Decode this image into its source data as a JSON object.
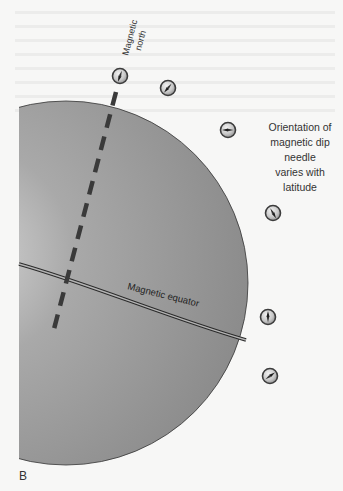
{
  "figure": {
    "panel_label": "B",
    "axis_label_line1": "Magnetic",
    "axis_label_line2": "north",
    "equator_label": "Magnetic equator",
    "caption_lines": [
      "Orientation of",
      "magnetic dip",
      "needle",
      "varies with",
      "latitude"
    ],
    "colors": {
      "sphere_light": "#c9c9c9",
      "sphere_dark": "#8a8a8a",
      "axis": "#3a3a3a",
      "outline": "#2e2e2e",
      "background": "#f7f7f6"
    },
    "dip_needles": [
      {
        "name": "needle-north-pole",
        "angle_deg": 200
      },
      {
        "name": "needle-high-latitude",
        "angle_deg": 220
      },
      {
        "name": "needle-mid-latitude",
        "angle_deg": 270
      },
      {
        "name": "needle-low-latitude",
        "angle_deg": 150
      },
      {
        "name": "needle-equator",
        "angle_deg": 0
      },
      {
        "name": "needle-southern-latitude",
        "angle_deg": 55
      }
    ]
  }
}
